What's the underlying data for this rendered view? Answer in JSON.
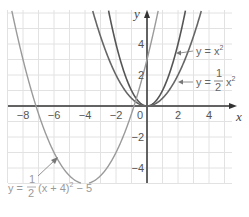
{
  "chart_data": {
    "type": "line",
    "title": "",
    "xlabel": "x",
    "ylabel": "y",
    "xlim": [
      -9,
      5.5
    ],
    "ylim": [
      -6,
      6.5
    ],
    "grid": true,
    "x_ticks": [
      "-8",
      "-6",
      "-4",
      "-2",
      "0",
      "2",
      "4"
    ],
    "y_ticks": [
      "4",
      "2",
      "-2",
      "-4"
    ],
    "series": [
      {
        "name": "y = x²",
        "formula": "x^2",
        "color": "#555555",
        "x": [
          -2.5,
          -2,
          -1,
          0,
          1,
          2,
          2.5
        ],
        "values": [
          6.25,
          4,
          1,
          0,
          1,
          4,
          6.25
        ]
      },
      {
        "name": "y = ½x²",
        "formula": "0.5*x^2",
        "color": "#666666",
        "x": [
          -3.5,
          -2,
          0,
          2,
          3.5
        ],
        "values": [
          6.125,
          2,
          0,
          2,
          6.125
        ]
      },
      {
        "name": "y = ½(x + 4)² − 5",
        "formula": "0.5*(x+4)^2-5",
        "color": "#9a9a9a",
        "x": [
          -7.6,
          -6,
          -4,
          -2,
          -0.4
        ],
        "values": [
          1.48,
          -3,
          -5,
          -3,
          1.48
        ]
      },
      {
        "name": "y = 3x + 3 (light partial)",
        "formula": "",
        "color": "#9a9a9a",
        "x": [],
        "values": []
      }
    ],
    "annotations": [
      {
        "text": "y = x²",
        "points_to": "y = x²"
      },
      {
        "text": "y = ½x²",
        "points_to": "y = ½x²"
      },
      {
        "text": "y = ½(x + 4)² − 5",
        "points_to": "y = ½(x + 4)² − 5"
      }
    ]
  },
  "labels": {
    "x_axis": "x",
    "y_axis": "y",
    "origin": "0",
    "eq1": "y = x",
    "eq1_exp": "2",
    "eq2_prefix": "y = ",
    "eq2_num": "1",
    "eq2_den": "2",
    "eq2_var": "x",
    "eq2_exp": "2",
    "eq3_prefix": "y = ",
    "eq3_num": "1",
    "eq3_den": "2",
    "eq3_body": "(x + 4)",
    "eq3_exp": "2",
    "eq3_tail": " − 5"
  }
}
